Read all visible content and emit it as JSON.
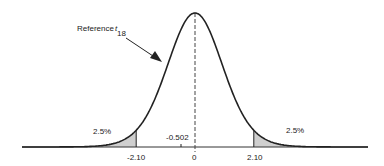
{
  "chart_data": {
    "type": "area",
    "title": "",
    "distribution": "t",
    "degrees_of_freedom": 18,
    "xlabel": "",
    "ylabel": "",
    "x_ticks": [
      -2.1,
      0,
      2.1
    ],
    "x_tick_labels": [
      "-2.10",
      "0",
      "2.10"
    ],
    "observed_value": -0.502,
    "critical_values": [
      -2.1,
      2.1
    ],
    "shaded_regions": [
      {
        "from": "-inf",
        "to": -2.1,
        "area_label": "2.5%",
        "area": 0.025
      },
      {
        "from": 2.1,
        "to": "inf",
        "area_label": "2.5%",
        "area": 0.025
      }
    ],
    "annotations": [
      {
        "text": "Reference",
        "subscript_symbol": "t",
        "subscript": "18",
        "arrow_to": "curve left flank"
      },
      {
        "text": "-0.502",
        "x": -0.502
      },
      {
        "text": "2.5%",
        "x": -2.6
      },
      {
        "text": "2.5%",
        "x": 2.6
      }
    ],
    "mean_line": {
      "x": 0,
      "style": "dashed"
    },
    "grid": false,
    "legend": null
  },
  "labels": {
    "reference": "Reference",
    "reference_t": "t",
    "reference_df": "18",
    "left_tail": "2.5%",
    "right_tail": "2.5%",
    "left_crit": "-2.10",
    "right_crit": "2.10",
    "zero": "0",
    "observed": "-0.502"
  }
}
